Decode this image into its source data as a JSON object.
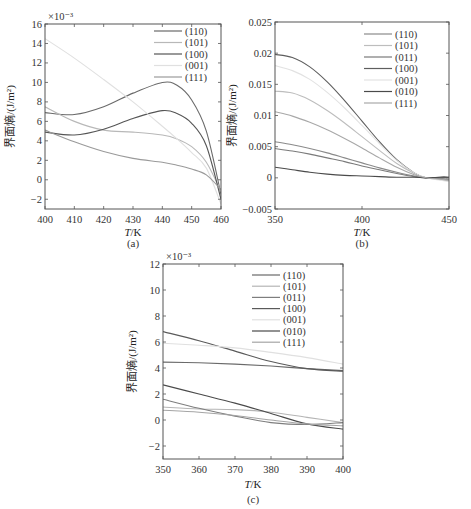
{
  "chart_data": [
    {
      "id": "a",
      "type": "line",
      "caption": "(a)",
      "xlabel": "T/K",
      "ylabel": "界面熵/(J/m²)",
      "y_multiplier": "×10⁻³",
      "xlim": [
        400,
        460
      ],
      "ylim": [
        -3,
        16
      ],
      "xticks": [
        400,
        410,
        420,
        430,
        440,
        450,
        460
      ],
      "yticks": [
        -2,
        0,
        2,
        4,
        6,
        8,
        10,
        12,
        14,
        16
      ],
      "legend_position": "upper right",
      "x": [
        400,
        410,
        420,
        430,
        440,
        445,
        450,
        455,
        460
      ],
      "series": [
        {
          "name": "(110)",
          "color": "#6a6a6a",
          "values": [
            6.9,
            6.7,
            7.5,
            8.9,
            10.0,
            9.7,
            8.2,
            5.0,
            -1.5
          ]
        },
        {
          "name": "(101)",
          "color": "#b8b8b8",
          "values": [
            7.5,
            6.0,
            5.1,
            4.9,
            4.6,
            4.2,
            3.4,
            1.8,
            -1.2
          ]
        },
        {
          "name": "(100)",
          "color": "#555555",
          "values": [
            4.9,
            4.6,
            5.2,
            6.3,
            7.1,
            6.8,
            5.8,
            3.5,
            -2.0
          ]
        },
        {
          "name": "(001)",
          "color": "#e0e0e0",
          "values": [
            14.5,
            12.5,
            10.3,
            8.0,
            5.5,
            4.2,
            2.8,
            1.2,
            -2.5
          ]
        },
        {
          "name": "(111)",
          "color": "#9a9a9a",
          "values": [
            5.1,
            3.9,
            2.9,
            2.2,
            1.8,
            1.5,
            1.1,
            0.5,
            -1.0
          ]
        }
      ]
    },
    {
      "id": "b",
      "type": "line",
      "caption": "(b)",
      "xlabel": "T/K",
      "ylabel": "界面熵/(J/m²)",
      "xlim": [
        350,
        450
      ],
      "ylim": [
        -0.005,
        0.025
      ],
      "xticks": [
        350,
        400,
        450
      ],
      "yticks": [
        -0.005,
        0,
        0.005,
        0.01,
        0.015,
        0.02,
        0.025
      ],
      "ytick_labels": [
        "-0.005",
        "0",
        "0.005",
        "0.01",
        "0.015",
        "0.02",
        "0.025"
      ],
      "legend_position": "upper right",
      "x": [
        350,
        360,
        370,
        380,
        390,
        400,
        410,
        420,
        430,
        437,
        445,
        450
      ],
      "series": [
        {
          "name": "(110)",
          "color": "#8a8a8a",
          "values": [
            0.0058,
            0.0053,
            0.0047,
            0.004,
            0.0032,
            0.0024,
            0.0016,
            0.0009,
            0.0003,
            0.0,
            -0.0002,
            -0.0003
          ]
        },
        {
          "name": "(101)",
          "color": "#bdbdbd",
          "values": [
            0.0139,
            0.0136,
            0.0125,
            0.0108,
            0.0088,
            0.0066,
            0.0044,
            0.0023,
            0.0007,
            0.0,
            -0.0003,
            -0.0005
          ]
        },
        {
          "name": "(011)",
          "color": "#7a7a7a",
          "values": [
            0.0047,
            0.0043,
            0.0038,
            0.0032,
            0.0026,
            0.0019,
            0.0013,
            0.0007,
            0.0002,
            0.0,
            -0.0001,
            -0.0002
          ]
        },
        {
          "name": "(100)",
          "color": "#5e5e5e",
          "values": [
            0.0198,
            0.0193,
            0.0178,
            0.0154,
            0.0124,
            0.0091,
            0.0058,
            0.0029,
            0.0008,
            0.0,
            0.0001,
            0.0001
          ]
        },
        {
          "name": "(001)",
          "color": "#e2e2e2",
          "values": [
            0.018,
            0.0172,
            0.0158,
            0.0137,
            0.0112,
            0.0084,
            0.0055,
            0.0028,
            0.0008,
            0.0,
            -0.0004,
            -0.0006
          ]
        },
        {
          "name": "(010)",
          "color": "#4a4a4a",
          "values": [
            0.0017,
            0.0013,
            0.0009,
            0.0006,
            0.0004,
            0.0003,
            0.0002,
            0.0001,
            0.0001,
            0.0,
            0.0001,
            0.0001
          ]
        },
        {
          "name": "(111)",
          "color": "#a8a8a8",
          "values": [
            0.0106,
            0.0099,
            0.0089,
            0.0077,
            0.0063,
            0.0048,
            0.0032,
            0.0017,
            0.0005,
            0.0,
            -0.0002,
            -0.0004
          ]
        }
      ]
    },
    {
      "id": "c",
      "type": "line",
      "caption": "(c)",
      "xlabel": "T/K",
      "ylabel": "界面熵/(J/m²)",
      "y_multiplier": "×10⁻³",
      "xlim": [
        350,
        400
      ],
      "ylim": [
        -3,
        12
      ],
      "xticks": [
        350,
        360,
        370,
        380,
        390,
        400
      ],
      "yticks": [
        -2,
        0,
        2,
        4,
        6,
        8,
        10,
        12
      ],
      "legend_position": "upper right",
      "x": [
        350,
        360,
        370,
        380,
        390,
        400
      ],
      "series": [
        {
          "name": "(110)",
          "color": "#6a6a6a",
          "values": [
            4.45,
            4.4,
            4.3,
            4.15,
            3.95,
            3.8
          ]
        },
        {
          "name": "(101)",
          "color": "#b5b5b5",
          "values": [
            1.0,
            0.85,
            0.8,
            0.6,
            0.2,
            -0.2
          ]
        },
        {
          "name": "(011)",
          "color": "#7e7e7e",
          "values": [
            1.6,
            0.9,
            0.3,
            -0.2,
            -0.35,
            -0.2
          ]
        },
        {
          "name": "(100)",
          "color": "#5a5a5a",
          "values": [
            6.8,
            6.1,
            5.3,
            4.5,
            3.95,
            3.75
          ]
        },
        {
          "name": "(001)",
          "color": "#e0e0e0",
          "values": [
            5.9,
            5.75,
            5.55,
            5.2,
            4.8,
            4.3
          ]
        },
        {
          "name": "(010)",
          "color": "#4a4a4a",
          "values": [
            2.7,
            2.0,
            1.3,
            0.5,
            -0.3,
            -0.7
          ]
        },
        {
          "name": "(111)",
          "color": "#a5a5a5",
          "values": [
            0.75,
            0.6,
            0.35,
            0.0,
            -0.3,
            -0.45
          ]
        }
      ]
    }
  ]
}
